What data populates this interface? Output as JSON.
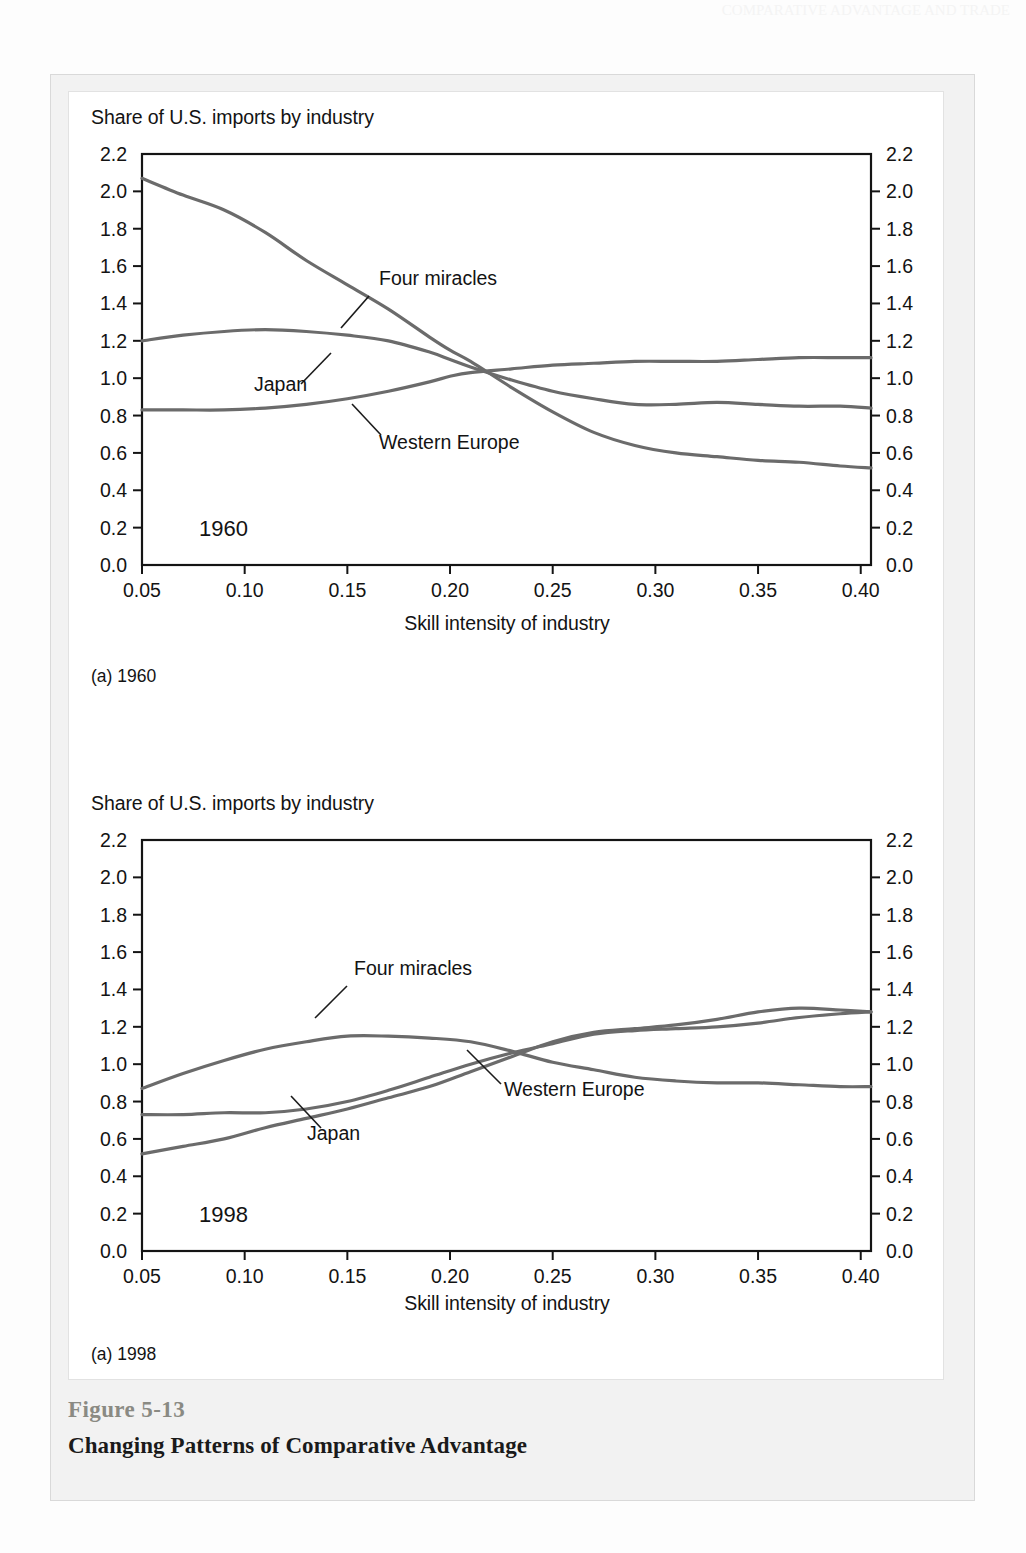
{
  "page": {
    "header_ghost": "COMPARATIVE ADVANTAGE AND TRADE"
  },
  "figure": {
    "number": "Figure 5-13",
    "title": "Changing Patterns of Comparative Advantage"
  },
  "panels": [
    {
      "id": "panel-1960",
      "ylabel_top": "Share of U.S. imports by industry",
      "xlabel": "Skill intensity of industry",
      "year_badge": "1960",
      "subcaption": "(a) 1960",
      "series_labels": {
        "four_miracles": "Four miracles",
        "japan": "Japan",
        "western_europe": "Western Europe"
      }
    },
    {
      "id": "panel-1998",
      "ylabel_top": "Share of U.S. imports by industry",
      "xlabel": "Skill intensity of industry",
      "year_badge": "1998",
      "subcaption": "(a) 1998",
      "series_labels": {
        "four_miracles": "Four miracles",
        "japan": "Japan",
        "western_europe": "Western Europe"
      }
    }
  ],
  "axes": {
    "y_ticks": [
      "0.0",
      "0.2",
      "0.4",
      "0.6",
      "0.8",
      "1.0",
      "1.2",
      "1.4",
      "1.6",
      "1.8",
      "2.0",
      "2.2"
    ],
    "x_ticks": [
      "0.05",
      "0.10",
      "0.15",
      "0.20",
      "0.25",
      "0.30",
      "0.35",
      "0.40"
    ],
    "ylim": [
      0.0,
      2.2
    ],
    "xlim": [
      0.05,
      0.405
    ],
    "grid": false,
    "mirrored_y_axis": true
  },
  "style": {
    "line_color": "#6b6b6b",
    "axis_color": "#141414",
    "panel_bg": "#f2f2f2",
    "card_bg": "#ffffff",
    "figure_number_color": "#8a8a83",
    "text_color": "#131313"
  },
  "chart_data": [
    {
      "type": "line",
      "title": "Share of U.S. imports by industry",
      "subtitle": "(a) 1960",
      "annotation": "1960",
      "xlabel": "Skill intensity of industry",
      "ylabel": "Share of U.S. imports by industry",
      "xlim": [
        0.05,
        0.405
      ],
      "ylim": [
        0.0,
        2.2
      ],
      "grid": false,
      "legend": "inline-annotations",
      "x": [
        0.05,
        0.07,
        0.09,
        0.11,
        0.13,
        0.15,
        0.17,
        0.19,
        0.2,
        0.21,
        0.23,
        0.25,
        0.27,
        0.29,
        0.31,
        0.33,
        0.35,
        0.37,
        0.39,
        0.405
      ],
      "series": [
        {
          "name": "Four miracles",
          "values": [
            2.07,
            1.98,
            1.9,
            1.78,
            1.63,
            1.5,
            1.37,
            1.22,
            1.15,
            1.09,
            0.95,
            0.82,
            0.71,
            0.64,
            0.6,
            0.58,
            0.56,
            0.55,
            0.53,
            0.52
          ]
        },
        {
          "name": "Japan",
          "values": [
            1.2,
            1.23,
            1.25,
            1.26,
            1.25,
            1.23,
            1.2,
            1.14,
            1.1,
            1.06,
            0.99,
            0.93,
            0.89,
            0.86,
            0.86,
            0.87,
            0.86,
            0.85,
            0.85,
            0.84
          ]
        },
        {
          "name": "Western Europe",
          "values": [
            0.83,
            0.83,
            0.83,
            0.84,
            0.86,
            0.89,
            0.93,
            0.98,
            1.01,
            1.03,
            1.05,
            1.07,
            1.08,
            1.09,
            1.09,
            1.09,
            1.1,
            1.11,
            1.11,
            1.11
          ]
        }
      ]
    },
    {
      "type": "line",
      "title": "Share of U.S. imports by industry",
      "subtitle": "(a) 1998",
      "annotation": "1998",
      "xlabel": "Skill intensity of industry",
      "ylabel": "Share of U.S. imports by industry",
      "xlim": [
        0.05,
        0.405
      ],
      "ylim": [
        0.0,
        2.2
      ],
      "grid": false,
      "legend": "inline-annotations",
      "x": [
        0.05,
        0.07,
        0.09,
        0.11,
        0.13,
        0.15,
        0.17,
        0.19,
        0.21,
        0.23,
        0.25,
        0.27,
        0.29,
        0.31,
        0.33,
        0.35,
        0.37,
        0.39,
        0.405
      ],
      "series": [
        {
          "name": "Four miracles",
          "values": [
            0.87,
            0.95,
            1.02,
            1.08,
            1.12,
            1.15,
            1.15,
            1.14,
            1.12,
            1.07,
            1.01,
            0.97,
            0.93,
            0.91,
            0.9,
            0.9,
            0.89,
            0.88,
            0.88
          ]
        },
        {
          "name": "Japan",
          "values": [
            0.52,
            0.56,
            0.6,
            0.66,
            0.71,
            0.76,
            0.82,
            0.88,
            0.96,
            1.04,
            1.12,
            1.17,
            1.19,
            1.21,
            1.24,
            1.28,
            1.3,
            1.29,
            1.28
          ]
        },
        {
          "name": "Western Europe",
          "values": [
            0.73,
            0.73,
            0.74,
            0.74,
            0.76,
            0.8,
            0.86,
            0.93,
            1.0,
            1.06,
            1.11,
            1.16,
            1.18,
            1.19,
            1.2,
            1.22,
            1.25,
            1.27,
            1.28
          ]
        }
      ]
    }
  ]
}
